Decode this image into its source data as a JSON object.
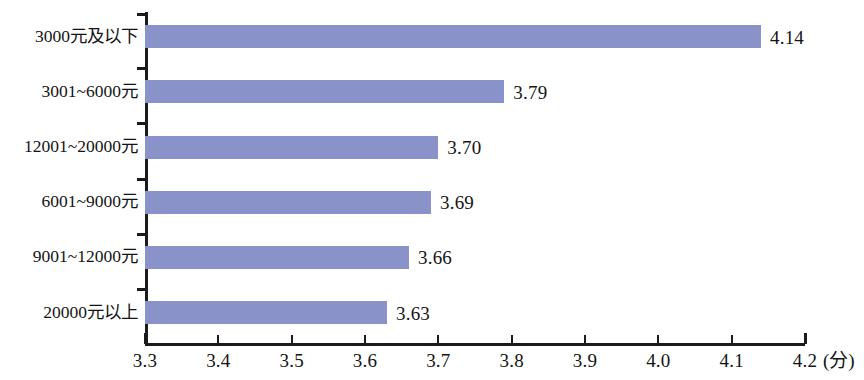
{
  "chart_data": {
    "type": "bar",
    "orientation": "horizontal",
    "title": "",
    "subtitle": "",
    "xlabel": "",
    "ylabel": "",
    "unit_label": "(分)",
    "categories": [
      "3000元及以下",
      "3001~6000元",
      "12001~20000元",
      "6001~9000元",
      "9001~12000元",
      "20000元以上"
    ],
    "values": [
      4.14,
      3.79,
      3.7,
      3.69,
      3.66,
      3.63
    ],
    "value_labels": [
      "4.14",
      "3.79",
      "3.70",
      "3.69",
      "3.66",
      "3.63"
    ],
    "xlim": [
      3.3,
      4.2
    ],
    "xticks": [
      3.3,
      3.4,
      3.5,
      3.6,
      3.7,
      3.8,
      3.9,
      4.0,
      4.1,
      4.2
    ],
    "xtick_labels": [
      "3.3",
      "3.4",
      "3.5",
      "3.6",
      "3.7",
      "3.8",
      "3.9",
      "4.0",
      "4.1",
      "4.2"
    ],
    "grid": false,
    "legend": null,
    "bar_color": "#8a93c9",
    "axis_color": "#1b1b1b"
  },
  "axis": {
    "unit": "(分)"
  }
}
